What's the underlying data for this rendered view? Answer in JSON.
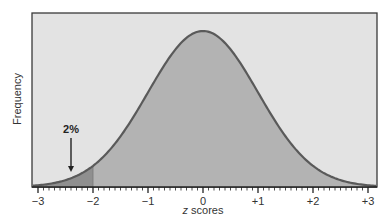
{
  "chart_data": {
    "type": "area",
    "title": "",
    "xlabel_italic": "z",
    "xlabel_rest": " scores",
    "xlabel": "z scores",
    "ylabel": "Frequency",
    "xlim": [
      -3,
      3
    ],
    "x_ticks": [
      -3,
      -2,
      -1,
      0,
      1,
      2,
      3
    ],
    "x_tick_labels": [
      "−3",
      "−2",
      "−1",
      "0",
      "+1",
      "+2",
      "+3"
    ],
    "minor_ticks_per_unit": 10,
    "distribution": "standard normal",
    "mean": 0,
    "sd": 1,
    "shaded_tail": {
      "from": -3,
      "to": -2,
      "label": "2%"
    },
    "annotation": {
      "text": "2%",
      "x": -2.4
    },
    "grid": false,
    "legend": null
  },
  "colors": {
    "frame_bg": "#e3e3e3",
    "frame_border": "#3a3a3a",
    "curve_fill": "#b3b3b3",
    "tail_fill": "#8f8f8f",
    "curve_stroke": "#5a5a5a",
    "axis": "#222222"
  }
}
